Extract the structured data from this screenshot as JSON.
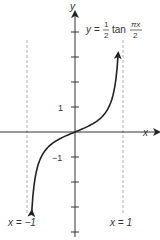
{
  "chart_data": {
    "type": "line",
    "title": "",
    "function_label": {
      "lhs": "y",
      "eq": "=",
      "coef_num": "1",
      "coef_den": "2",
      "fn": "tan",
      "arg_num": "πx",
      "arg_den": "2"
    },
    "expression": "y = (1/2) tan(πx/2)",
    "xlabel": "x",
    "ylabel": "y",
    "xlim": [
      -1.6,
      1.75
    ],
    "ylim": [
      -4.2,
      4.8
    ],
    "y_ticks": [
      -4,
      -3,
      -2,
      -1,
      1,
      2,
      3,
      4
    ],
    "y_tick_labels": [
      {
        "value": 1,
        "label": "1"
      },
      {
        "value": -1,
        "label": "−1"
      }
    ],
    "asymptotes": [
      {
        "x": -1,
        "label": "x = −1"
      },
      {
        "x": 1,
        "label": "x = 1"
      }
    ],
    "domain": [
      -0.9,
      0.9
    ],
    "grid": false,
    "colors": {
      "axis": "#333333",
      "curve": "#222222",
      "asymptote": "#999999"
    }
  }
}
